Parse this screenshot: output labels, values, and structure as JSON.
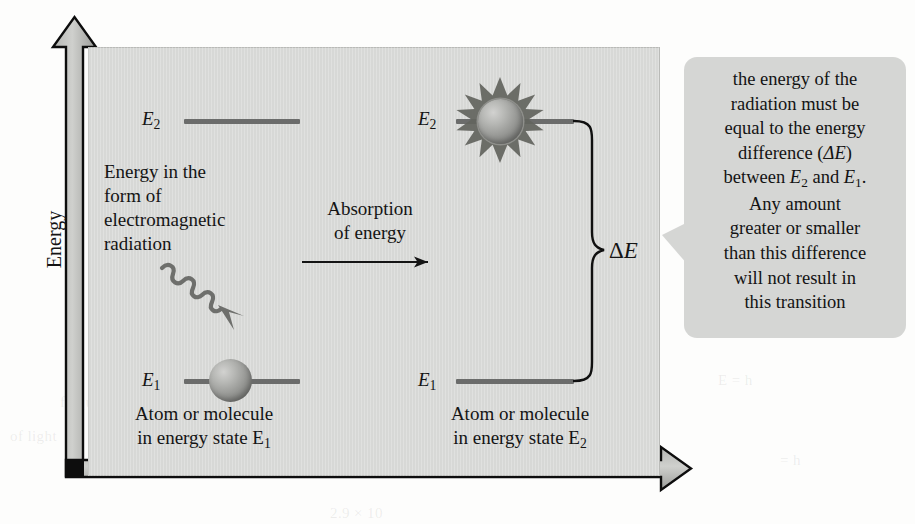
{
  "figure": {
    "type": "energy-level-absorption-diagram",
    "y_axis_label": "Energy",
    "panel_color": "#d7d8d6",
    "level_color": "#6b6c6b",
    "callout_color": "#d5d6d4"
  },
  "left_panel": {
    "upper_level_label": "E",
    "upper_level_sub": "2",
    "lower_level_label": "E",
    "lower_level_sub": "1",
    "radiation_text_lines": [
      "Energy in the",
      "form of",
      "electromagnetic",
      "radiation"
    ],
    "caption_lines": [
      "Atom or molecule",
      "in energy state E"
    ],
    "caption_sub": "1",
    "photon_icon": "wavy-arrow-icon",
    "atom_icon": "sphere-icon"
  },
  "middle": {
    "process_label_lines": [
      "Absorption",
      "of energy"
    ],
    "arrow_icon": "right-arrow-icon"
  },
  "right_panel": {
    "upper_level_label": "E",
    "upper_level_sub": "2",
    "lower_level_label": "E",
    "lower_level_sub": "1",
    "caption_lines": [
      "Atom or molecule",
      "in energy state E"
    ],
    "caption_sub": "2",
    "excited_atom_icon": "starburst-sphere-icon",
    "delta_symbol": "Δ",
    "delta_label": "E",
    "brace_icon": "curly-brace-icon"
  },
  "callout": {
    "lines": [
      "the energy of the",
      "radiation must be",
      "equal to the energy",
      "difference (ΔE)",
      "between E2 and E1.",
      "Any amount",
      "greater or smaller",
      "than this difference",
      "will not result in",
      "this transition"
    ],
    "line_1": "the energy of the",
    "line_2": "radiation must be",
    "line_3": "equal to the energy",
    "line_4_a": "difference (",
    "line_4_delta": "ΔE",
    "line_4_b": ")",
    "line_5_a": "between ",
    "line_5_e2": "E",
    "line_5_e2sub": "2",
    "line_5_and": " and ",
    "line_5_e1": "E",
    "line_5_e1sub": "1",
    "line_5_b": ".",
    "line_6": "Any amount",
    "line_7": "greater or smaller",
    "line_8": "than this difference",
    "line_9": "will not result in",
    "line_10": "this transition"
  },
  "background_ghost_text": {
    "g1": "of radiation",
    "g2": "the energy",
    "g3": "E = h",
    "g4": "frequency. The number",
    "g5": "of light",
    "g6": "2.9 × 10",
    "g7": "= h"
  }
}
